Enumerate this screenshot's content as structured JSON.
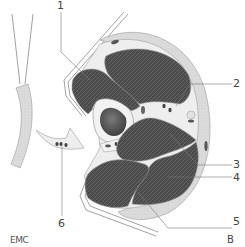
{
  "diagram": {
    "type": "anatomical-cross-section",
    "labels": [
      {
        "id": "1",
        "text": "1"
      },
      {
        "id": "2",
        "text": "2"
      },
      {
        "id": "3",
        "text": "3"
      },
      {
        "id": "4",
        "text": "4"
      },
      {
        "id": "5",
        "text": "5"
      },
      {
        "id": "6",
        "text": "6"
      }
    ],
    "credit": "EMC",
    "panel": "B",
    "colors": {
      "muscle": "#4a4a4a",
      "fascia": "#e9e9e9",
      "skin": "#d6d6d6",
      "outline": "#8a8a8a",
      "bone_cavity": "#555555",
      "background": "#ffffff"
    }
  }
}
